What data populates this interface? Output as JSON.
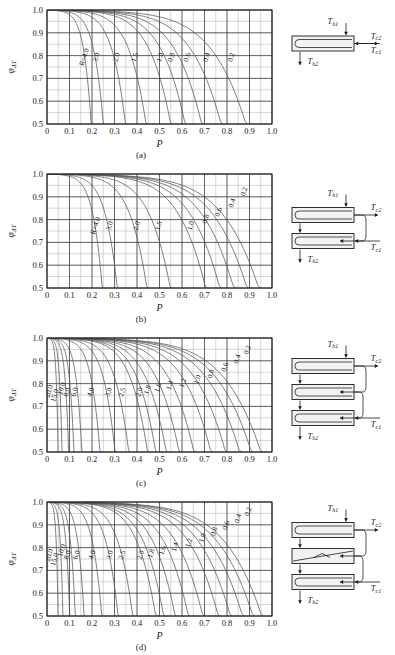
{
  "figure": {
    "axis": {
      "xlabel": "P",
      "ylabel_base": "φ",
      "ylabel_sub": "ΔT",
      "xticks": [
        "0",
        "0.1",
        "0.2",
        "0.3",
        "0.4",
        "0.5",
        "0.6",
        "0.7",
        "0.8",
        "0.9",
        "1.0"
      ],
      "yticks": [
        "0.5",
        "0.6",
        "0.7",
        "0.8",
        "0.9",
        "1.0"
      ],
      "xlim": [
        0,
        1.0
      ],
      "ylim": [
        0.5,
        1.0
      ],
      "major_x_step": 0.1,
      "minor_x_step": 0.05,
      "major_y_step": 0.1,
      "minor_y_step": 0.05,
      "grid": "major-and-minor"
    },
    "temperature_labels": {
      "hot_in": "T",
      "hot_in_sub": "h1",
      "hot_out": "T",
      "hot_out_sub": "h2",
      "cold_in": "T",
      "cold_in_sub": "c1",
      "cold_out": "T",
      "cold_out_sub": "c2"
    },
    "r_prefix": "R=",
    "colors": {
      "curve": "#555555",
      "grid_major": "#333333",
      "grid_minor": "#9a9a9a",
      "axis": "#1a1a1a",
      "schematic_line": "#1a1a1a",
      "schematic_fill": "#f2f2f2"
    }
  },
  "panels": [
    {
      "id": "a",
      "caption": "(a)",
      "shells": 1,
      "baffled_shell_index": -1,
      "chart_data": {
        "type": "line",
        "title": "",
        "xlabel": "P",
        "ylabel": "φΔT",
        "xlim": [
          0,
          1.0
        ],
        "ylim": [
          0.5,
          1.0
        ],
        "grid": true,
        "legend": "inline-curve-labels",
        "first_label_has_r_prefix": true,
        "series": [
          {
            "name": "4.0",
            "R": 4.0,
            "label_x": 0.175,
            "label_y": 0.79,
            "asymptote_P": 0.2
          },
          {
            "name": "3.0",
            "R": 3.0,
            "label_x": 0.228,
            "label_y": 0.79,
            "asymptote_P": 0.255
          },
          {
            "name": "2.0",
            "R": 2.0,
            "label_x": 0.318,
            "label_y": 0.79,
            "asymptote_P": 0.355
          },
          {
            "name": "1.5",
            "R": 1.5,
            "label_x": 0.4,
            "label_y": 0.79,
            "asymptote_P": 0.448
          },
          {
            "name": "1.0",
            "R": 1.0,
            "label_x": 0.512,
            "label_y": 0.79,
            "asymptote_P": 0.56
          },
          {
            "name": "0.8",
            "R": 0.8,
            "label_x": 0.562,
            "label_y": 0.79,
            "asymptote_P": 0.625
          },
          {
            "name": "0.6",
            "R": 0.6,
            "label_x": 0.632,
            "label_y": 0.79,
            "asymptote_P": 0.7
          },
          {
            "name": "0.4",
            "R": 0.4,
            "label_x": 0.718,
            "label_y": 0.79,
            "asymptote_P": 0.788
          },
          {
            "name": "0.2",
            "R": 0.2,
            "label_x": 0.828,
            "label_y": 0.79,
            "asymptote_P": 0.9
          }
        ]
      }
    },
    {
      "id": "b",
      "caption": "(b)",
      "shells": 2,
      "baffled_shell_index": -1,
      "chart_data": {
        "type": "line",
        "title": "",
        "xlabel": "P",
        "ylabel": "φΔT",
        "xlim": [
          0,
          1.0
        ],
        "ylim": [
          0.5,
          1.0
        ],
        "grid": true,
        "legend": "inline-curve-labels",
        "first_label_has_r_prefix": true,
        "series": [
          {
            "name": "4.0",
            "R": 4.0,
            "label_x": 0.225,
            "label_y": 0.77,
            "asymptote_P": 0.25
          },
          {
            "name": "3.0",
            "R": 3.0,
            "label_x": 0.288,
            "label_y": 0.77,
            "asymptote_P": 0.318
          },
          {
            "name": "2.0",
            "R": 2.0,
            "label_x": 0.408,
            "label_y": 0.77,
            "asymptote_P": 0.452
          },
          {
            "name": "1.5",
            "R": 1.5,
            "label_x": 0.505,
            "label_y": 0.77,
            "asymptote_P": 0.558
          },
          {
            "name": "1.0",
            "R": 1.0,
            "label_x": 0.648,
            "label_y": 0.77,
            "asymptote_P": 0.718
          },
          {
            "name": "0.8",
            "R": 0.8,
            "label_x": 0.715,
            "label_y": 0.8,
            "asymptote_P": 0.782
          },
          {
            "name": "0.6",
            "R": 0.6,
            "label_x": 0.772,
            "label_y": 0.83,
            "asymptote_P": 0.845
          },
          {
            "name": "0.4",
            "R": 0.4,
            "label_x": 0.832,
            "label_y": 0.87,
            "asymptote_P": 0.905
          },
          {
            "name": "0.2",
            "R": 0.2,
            "label_x": 0.885,
            "label_y": 0.92,
            "asymptote_P": 0.958
          }
        ]
      }
    },
    {
      "id": "c",
      "caption": "(c)",
      "shells": 3,
      "baffled_shell_index": -1,
      "chart_data": {
        "type": "line",
        "title": "",
        "xlabel": "P",
        "ylabel": "φΔT",
        "xlim": [
          0,
          1.0
        ],
        "ylim": [
          0.5,
          1.0
        ],
        "grid": true,
        "legend": "inline-curve-labels",
        "first_label_has_r_prefix": true,
        "series": [
          {
            "name": "20.0",
            "R": 20.0,
            "label_x": 0.013,
            "label_y": 0.745,
            "asymptote_P": 0.05
          },
          {
            "name": "15.0",
            "R": 15.0,
            "label_x": 0.043,
            "label_y": 0.745,
            "asymptote_P": 0.068
          },
          {
            "name": "10.0",
            "R": 10.0,
            "label_x": 0.075,
            "label_y": 0.775,
            "asymptote_P": 0.098
          },
          {
            "name": "8.0",
            "R": 8.0,
            "label_x": 0.098,
            "label_y": 0.76,
            "asymptote_P": 0.122
          },
          {
            "name": "6.0",
            "R": 6.0,
            "label_x": 0.132,
            "label_y": 0.76,
            "asymptote_P": 0.158
          },
          {
            "name": "4.0",
            "R": 4.0,
            "label_x": 0.203,
            "label_y": 0.76,
            "asymptote_P": 0.24
          },
          {
            "name": "3.0",
            "R": 3.0,
            "label_x": 0.283,
            "label_y": 0.76,
            "asymptote_P": 0.308
          },
          {
            "name": "2.5",
            "R": 2.5,
            "label_x": 0.343,
            "label_y": 0.76,
            "asymptote_P": 0.37
          },
          {
            "name": "2.0",
            "R": 2.0,
            "label_x": 0.42,
            "label_y": 0.76,
            "asymptote_P": 0.455
          },
          {
            "name": "1.8",
            "R": 1.8,
            "label_x": 0.455,
            "label_y": 0.77,
            "asymptote_P": 0.492
          },
          {
            "name": "1.6",
            "R": 1.6,
            "label_x": 0.502,
            "label_y": 0.78,
            "asymptote_P": 0.54
          },
          {
            "name": "1.4",
            "R": 1.4,
            "label_x": 0.555,
            "label_y": 0.79,
            "asymptote_P": 0.598
          },
          {
            "name": "1.2",
            "R": 1.2,
            "label_x": 0.613,
            "label_y": 0.8,
            "asymptote_P": 0.665
          },
          {
            "name": "1.0",
            "R": 1.0,
            "label_x": 0.678,
            "label_y": 0.815,
            "asymptote_P": 0.742
          },
          {
            "name": "0.8",
            "R": 0.8,
            "label_x": 0.738,
            "label_y": 0.84,
            "asymptote_P": 0.808
          },
          {
            "name": "0.6",
            "R": 0.6,
            "label_x": 0.8,
            "label_y": 0.87,
            "asymptote_P": 0.872
          },
          {
            "name": "0.4",
            "R": 0.4,
            "label_x": 0.855,
            "label_y": 0.905,
            "asymptote_P": 0.925
          },
          {
            "name": "0.2",
            "R": 0.2,
            "label_x": 0.9,
            "label_y": 0.945,
            "asymptote_P": 0.968
          }
        ]
      }
    },
    {
      "id": "d",
      "caption": "(d)",
      "shells": 3,
      "baffled_shell_index": 1,
      "chart_data": {
        "type": "line",
        "title": "",
        "xlabel": "P",
        "ylabel": "φΔT",
        "xlim": [
          0,
          1.0
        ],
        "ylim": [
          0.5,
          1.0
        ],
        "grid": true,
        "legend": "inline-curve-labels",
        "first_label_has_r_prefix": true,
        "series": [
          {
            "name": "20.0",
            "R": 20.0,
            "label_x": 0.013,
            "label_y": 0.745,
            "asymptote_P": 0.05
          },
          {
            "name": "15.0",
            "R": 15.0,
            "label_x": 0.043,
            "label_y": 0.745,
            "asymptote_P": 0.072
          },
          {
            "name": "10.0",
            "R": 10.0,
            "label_x": 0.075,
            "label_y": 0.785,
            "asymptote_P": 0.103
          },
          {
            "name": "8.0",
            "R": 8.0,
            "label_x": 0.1,
            "label_y": 0.765,
            "asymptote_P": 0.128
          },
          {
            "name": "6.0",
            "R": 6.0,
            "label_x": 0.14,
            "label_y": 0.765,
            "asymptote_P": 0.168
          },
          {
            "name": "4.0",
            "R": 4.0,
            "label_x": 0.21,
            "label_y": 0.765,
            "asymptote_P": 0.248
          },
          {
            "name": "3.0",
            "R": 3.0,
            "label_x": 0.288,
            "label_y": 0.765,
            "asymptote_P": 0.322
          },
          {
            "name": "2.5",
            "R": 2.5,
            "label_x": 0.343,
            "label_y": 0.765,
            "asymptote_P": 0.388
          },
          {
            "name": "2.0",
            "R": 2.0,
            "label_x": 0.425,
            "label_y": 0.765,
            "asymptote_P": 0.492
          },
          {
            "name": "1.8",
            "R": 1.8,
            "label_x": 0.472,
            "label_y": 0.772,
            "asymptote_P": 0.528
          },
          {
            "name": "1.6",
            "R": 1.6,
            "label_x": 0.523,
            "label_y": 0.785,
            "asymptote_P": 0.58
          },
          {
            "name": "1.4",
            "R": 1.4,
            "label_x": 0.578,
            "label_y": 0.8,
            "asymptote_P": 0.64
          },
          {
            "name": "1.2",
            "R": 1.2,
            "label_x": 0.64,
            "label_y": 0.818,
            "asymptote_P": 0.705
          },
          {
            "name": "1.0",
            "R": 1.0,
            "label_x": 0.7,
            "label_y": 0.84,
            "asymptote_P": 0.775
          },
          {
            "name": "0.8",
            "R": 0.8,
            "label_x": 0.752,
            "label_y": 0.868,
            "asymptote_P": 0.83
          },
          {
            "name": "0.6",
            "R": 0.6,
            "label_x": 0.805,
            "label_y": 0.895,
            "asymptote_P": 0.885
          },
          {
            "name": "0.4",
            "R": 0.4,
            "label_x": 0.858,
            "label_y": 0.925,
            "asymptote_P": 0.932
          },
          {
            "name": "0.2",
            "R": 0.2,
            "label_x": 0.903,
            "label_y": 0.955,
            "asymptote_P": 0.972
          }
        ]
      }
    }
  ]
}
